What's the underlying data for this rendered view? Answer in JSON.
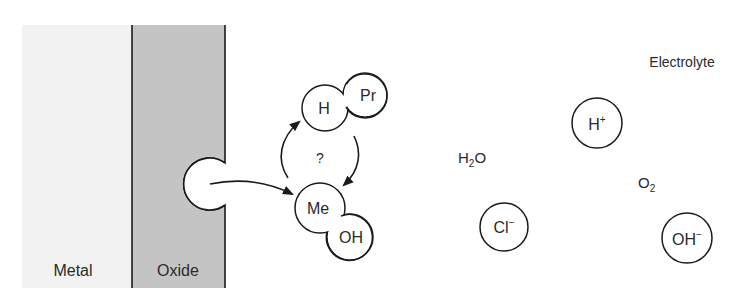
{
  "diagram": {
    "type": "pitting-corrosion-schematic",
    "regions": {
      "metal": {
        "label": "Metal",
        "color": "#f2f2f2"
      },
      "oxide": {
        "label": "Oxide",
        "color": "#c4c4c4"
      },
      "electrolyte": {
        "label": "Electrolyte"
      }
    },
    "complexes": {
      "adsorbed": {
        "left": "H",
        "right": "Pr"
      },
      "surface": {
        "left": "Me",
        "right": "OH"
      }
    },
    "cycle_label": "?",
    "species": {
      "h_plus": {
        "base": "H",
        "sup": "+"
      },
      "cl_minus": {
        "base": "Cl",
        "sup": "−"
      },
      "oh_minus": {
        "base": "OH",
        "sup": "−"
      },
      "water": {
        "base": "H",
        "sub": "2",
        "tail": "O"
      },
      "oxygen": {
        "base": "O",
        "sub": "2"
      }
    }
  }
}
